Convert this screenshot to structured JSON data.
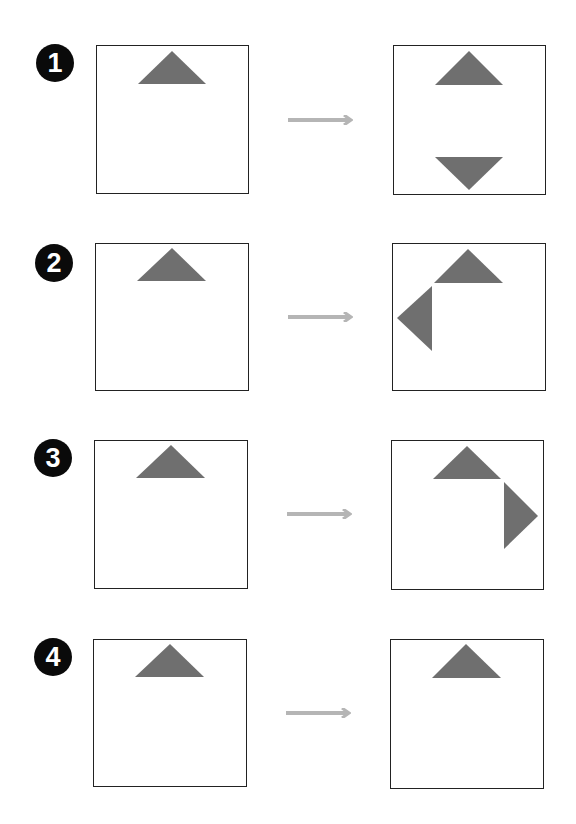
{
  "colors": {
    "badge_fill": "#0a0a0a",
    "badge_text": "#ffffff",
    "box_border": "#222222",
    "triangle_fill": "#6f6f6f",
    "arrow": "#b5b5b5",
    "background": "#ffffff"
  },
  "steps": [
    {
      "number": "1",
      "before": {
        "triangles": [
          "top-pointing-up"
        ]
      },
      "after": {
        "triangles": [
          "top-pointing-up",
          "bottom-pointing-down"
        ]
      }
    },
    {
      "number": "2",
      "before": {
        "triangles": [
          "top-pointing-up"
        ]
      },
      "after": {
        "triangles": [
          "top-pointing-up",
          "left-pointing-left"
        ]
      }
    },
    {
      "number": "3",
      "before": {
        "triangles": [
          "top-pointing-up"
        ]
      },
      "after": {
        "triangles": [
          "top-pointing-up",
          "right-pointing-right"
        ]
      }
    },
    {
      "number": "4",
      "before": {
        "triangles": [
          "top-pointing-up"
        ]
      },
      "after": {
        "triangles": [
          "top-pointing-up"
        ]
      }
    }
  ]
}
